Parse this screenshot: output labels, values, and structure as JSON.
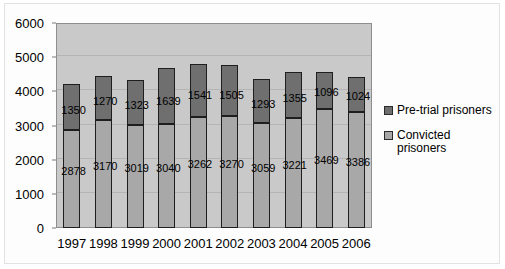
{
  "chart_data": {
    "type": "bar",
    "stacked": true,
    "title": "",
    "xlabel": "",
    "ylabel": "",
    "ylim": [
      0,
      6000
    ],
    "ytick_step": 1000,
    "yticks": [
      "0",
      "1000",
      "2000",
      "3000",
      "4000",
      "5000",
      "6000"
    ],
    "grid": true,
    "legend_position": "right",
    "categories": [
      "1997",
      "1998",
      "1999",
      "2000",
      "2001",
      "2002",
      "2003",
      "2004",
      "2005",
      "2006"
    ],
    "series": [
      {
        "name": "Convicted prisoners",
        "color": "#a8a8a8",
        "values": [
          2878,
          3170,
          3019,
          3040,
          3262,
          3270,
          3059,
          3221,
          3469,
          3386
        ]
      },
      {
        "name": "Pre-trial prisoners",
        "color": "#6f6f6f",
        "values": [
          1350,
          1270,
          1323,
          1639,
          1541,
          1505,
          1293,
          1355,
          1096,
          1024
        ]
      }
    ]
  },
  "legend": {
    "items": [
      {
        "label": "Pre-trial prisoners",
        "swatch": "pretrial"
      },
      {
        "label": "Convicted prisoners",
        "swatch": "convicted"
      }
    ]
  },
  "colors": {
    "plot_background": "#c9c9c9",
    "gridline": "#b4b4b4",
    "pretrial": "#6f6f6f",
    "convicted": "#a8a8a8",
    "axis": "#8e8e8e"
  }
}
